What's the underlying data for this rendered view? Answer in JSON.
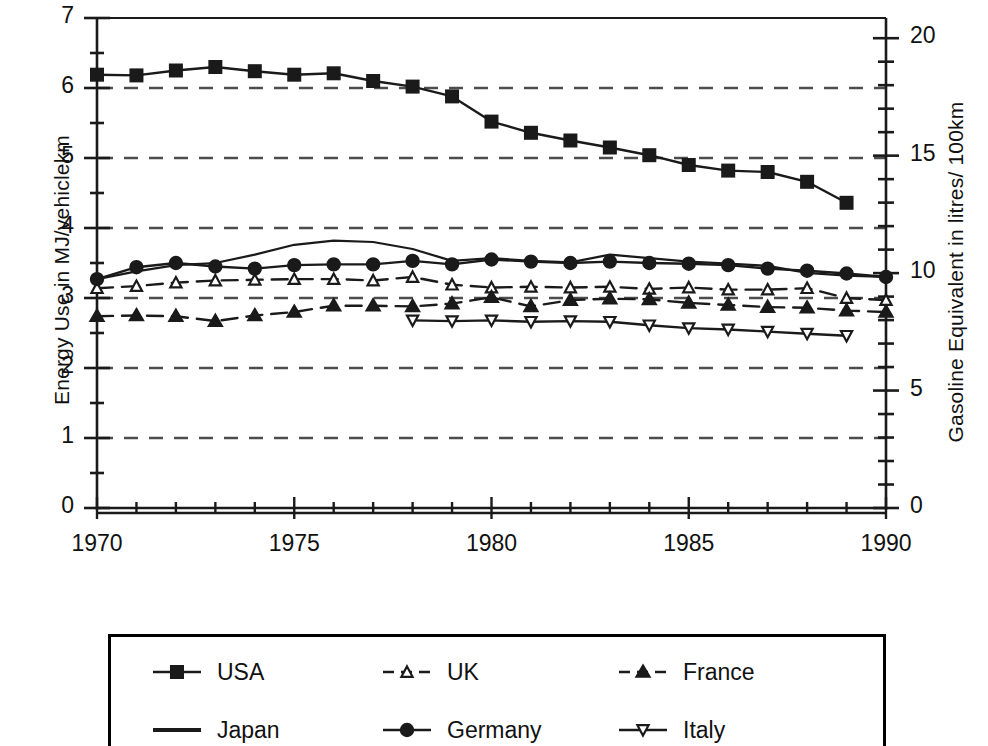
{
  "chart_data": {
    "type": "line",
    "title": "",
    "subtitle": "",
    "xlabel": "",
    "ylabel": "Energy Use in MJ/vehiclekm",
    "ylabel_right": "Gasoline Equivalent in litres/ 100km",
    "xlim": [
      1970,
      1990
    ],
    "ylim": [
      0,
      7
    ],
    "ylim_right": [
      0,
      20.86
    ],
    "xticks": [
      1970,
      1975,
      1980,
      1985,
      1990
    ],
    "xtick_labels": [
      "1970",
      "1975",
      "1980",
      "1985",
      "1990"
    ],
    "x_minor_tick_step": 1,
    "yticks": [
      0,
      1,
      2,
      3,
      4,
      5,
      6,
      7
    ],
    "ytick_labels": [
      "0",
      "1",
      "2",
      "3",
      "4",
      "5",
      "6",
      "7"
    ],
    "y_minor_tick_step": 0.5,
    "yticks_right": [
      0,
      5,
      10,
      15,
      20
    ],
    "ytick_labels_right": [
      "0",
      "5",
      "10",
      "15",
      "20"
    ],
    "y_right_minor_tick_step": 1,
    "grid": true,
    "grid_style": "dashed-horizontal",
    "grid_values": [
      1,
      2,
      3,
      4,
      5,
      6
    ],
    "legend_position": "below-plot",
    "series": [
      {
        "name": "USA",
        "marker": "filled-square",
        "line": "solid",
        "x": [
          1970,
          1971,
          1972,
          1973,
          1974,
          1975,
          1976,
          1977,
          1978,
          1979,
          1980,
          1981,
          1982,
          1983,
          1984,
          1985,
          1986,
          1987,
          1988,
          1989
        ],
        "values": [
          6.19,
          6.18,
          6.25,
          6.3,
          6.24,
          6.19,
          6.21,
          6.1,
          6.02,
          5.88,
          5.52,
          5.36,
          5.25,
          5.15,
          5.04,
          4.9,
          4.82,
          4.8,
          4.66,
          4.36
        ]
      },
      {
        "name": "Japan",
        "marker": "none",
        "line": "solid",
        "x": [
          1970,
          1971,
          1972,
          1973,
          1974,
          1975,
          1976,
          1977,
          1978,
          1979,
          1980,
          1981,
          1982,
          1983,
          1984,
          1985,
          1986,
          1987,
          1988,
          1989,
          1990
        ],
        "values": [
          3.27,
          3.38,
          3.47,
          3.5,
          3.62,
          3.76,
          3.82,
          3.8,
          3.7,
          3.53,
          3.57,
          3.53,
          3.51,
          3.62,
          3.57,
          3.52,
          3.49,
          3.46,
          3.36,
          3.32,
          3.3
        ]
      },
      {
        "name": "UK",
        "marker": "open-triangle-up",
        "line": "dashed",
        "x": [
          1970,
          1971,
          1972,
          1973,
          1974,
          1975,
          1976,
          1977,
          1978,
          1979,
          1980,
          1981,
          1982,
          1983,
          1984,
          1985,
          1986,
          1987,
          1988,
          1989,
          1990
        ],
        "values": [
          3.14,
          3.17,
          3.22,
          3.25,
          3.26,
          3.27,
          3.27,
          3.25,
          3.3,
          3.19,
          3.15,
          3.16,
          3.15,
          3.16,
          3.13,
          3.15,
          3.12,
          3.12,
          3.14,
          3.0,
          2.97
        ]
      },
      {
        "name": "Germany",
        "marker": "filled-circle",
        "line": "solid",
        "x": [
          1970,
          1971,
          1972,
          1973,
          1974,
          1975,
          1976,
          1977,
          1978,
          1979,
          1980,
          1981,
          1982,
          1983,
          1984,
          1985,
          1986,
          1987,
          1988,
          1989,
          1990
        ],
        "values": [
          3.27,
          3.44,
          3.5,
          3.45,
          3.42,
          3.47,
          3.48,
          3.48,
          3.53,
          3.48,
          3.55,
          3.52,
          3.5,
          3.52,
          3.5,
          3.49,
          3.47,
          3.42,
          3.39,
          3.35,
          3.3
        ]
      },
      {
        "name": "France",
        "marker": "filled-triangle-up",
        "line": "dashed",
        "x": [
          1970,
          1971,
          1972,
          1973,
          1974,
          1975,
          1976,
          1977,
          1978,
          1979,
          1980,
          1981,
          1982,
          1983,
          1984,
          1985,
          1986,
          1987,
          1988,
          1989,
          1990
        ],
        "values": [
          2.74,
          2.75,
          2.74,
          2.67,
          2.75,
          2.8,
          2.89,
          2.89,
          2.88,
          2.92,
          3.01,
          2.88,
          2.97,
          2.99,
          2.98,
          2.93,
          2.9,
          2.87,
          2.86,
          2.82,
          2.8
        ]
      },
      {
        "name": "Italy",
        "marker": "open-triangle-down",
        "line": "solid",
        "x": [
          1978,
          1979,
          1980,
          1981,
          1982,
          1983,
          1984,
          1985,
          1986,
          1987,
          1988,
          1989
        ],
        "values": [
          2.68,
          2.67,
          2.68,
          2.66,
          2.67,
          2.66,
          2.61,
          2.57,
          2.55,
          2.52,
          2.49,
          2.46
        ]
      }
    ]
  },
  "axes": {
    "left_title": "Energy Use in MJ/vehiclekm",
    "right_title": "Gasoline Equivalent in litres/ 100km",
    "left_ticks": [
      "7",
      "6",
      "5",
      "4",
      "3",
      "2",
      "1",
      "0"
    ],
    "right_ticks": [
      "20",
      "15",
      "10",
      "5",
      "0"
    ],
    "x_ticks": [
      "1970",
      "1975",
      "1980",
      "1985",
      "1990"
    ]
  },
  "legend": {
    "items": [
      {
        "label": "USA",
        "marker": "filled-square",
        "line": "solid",
        "col": 0,
        "row": 0
      },
      {
        "label": "UK",
        "marker": "open-triangle-up",
        "line": "dashed",
        "col": 1,
        "row": 0
      },
      {
        "label": "France",
        "marker": "filled-triangle-up",
        "line": "dashed",
        "col": 2,
        "row": 0
      },
      {
        "label": "Japan",
        "marker": "none",
        "line": "solid",
        "col": 0,
        "row": 1
      },
      {
        "label": "Germany",
        "marker": "filled-circle",
        "line": "solid",
        "col": 1,
        "row": 1
      },
      {
        "label": "Italy",
        "marker": "open-triangle-down",
        "line": "solid",
        "col": 2,
        "row": 1
      }
    ]
  },
  "colors": {
    "ink": "#1a1a1a",
    "grid": "#4d4d4d",
    "background": "#ffffff"
  }
}
